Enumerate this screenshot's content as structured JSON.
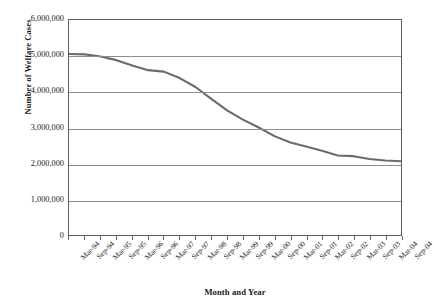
{
  "chart_data": {
    "type": "line",
    "title": "",
    "xlabel": "Month and Year",
    "ylabel": "Number of Welfare Cases",
    "ylim": [
      0,
      6000000
    ],
    "y_ticks": [
      6000000,
      5000000,
      4000000,
      3000000,
      2000000,
      1000000,
      0
    ],
    "y_tick_labels": [
      "6,000,000",
      "5,000,000",
      "4,000,000",
      "3,000,000",
      "2,000,000",
      "1,000,000",
      "0"
    ],
    "grid": "horizontal",
    "legend": "none",
    "line_color": "#6b6b6b",
    "categories": [
      "Mar-94",
      "Sep-94",
      "Mar-95",
      "Sep-95",
      "Mar-96",
      "Sep-96",
      "Mar-97",
      "Sep-97",
      "Mar-98",
      "Sep-98",
      "Mar-99",
      "Sep-99",
      "Mar-00",
      "Sep-00",
      "Mar-01",
      "Sep-01",
      "Mar-02",
      "Sep-02",
      "Mar-03",
      "Sep-03",
      "Mar-04",
      "Sep-04"
    ],
    "values": [
      5050000,
      5040000,
      4980000,
      4880000,
      4730000,
      4600000,
      4560000,
      4380000,
      4130000,
      3800000,
      3480000,
      3220000,
      3000000,
      2760000,
      2580000,
      2470000,
      2350000,
      2220000,
      2200000,
      2120000,
      2080000,
      2060000
    ]
  }
}
